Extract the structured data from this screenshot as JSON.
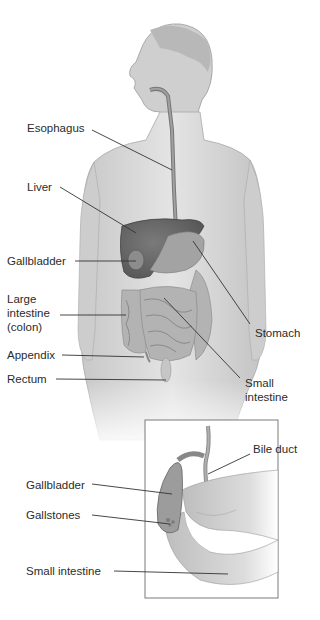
{
  "diagram": {
    "type": "anatomy-illustration",
    "palette": {
      "ink": "#2b2b2b",
      "skin": "#d6d6d6",
      "organ_dark": "#6a6a6a",
      "organ_mid": "#9a9a9a",
      "frame": "#7a7a7a"
    },
    "main_labels": [
      {
        "id": "esophagus",
        "text": "Esophagus"
      },
      {
        "id": "liver",
        "text": "Liver"
      },
      {
        "id": "gallbladder",
        "text": "Gallbladder"
      },
      {
        "id": "large_intestine",
        "text": "Large intestine (colon)",
        "lines": [
          "Large",
          "intestine",
          "(colon)"
        ]
      },
      {
        "id": "appendix",
        "text": "Appendix"
      },
      {
        "id": "rectum",
        "text": "Rectum"
      },
      {
        "id": "stomach",
        "text": "Stomach"
      },
      {
        "id": "small_intestine",
        "text": "Small intestine",
        "lines": [
          "Small",
          "intestine"
        ]
      }
    ],
    "inset_labels": [
      {
        "id": "bile_duct",
        "text": "Bile duct"
      },
      {
        "id": "gallbladder",
        "text": "Gallbladder"
      },
      {
        "id": "gallstones",
        "text": "Gallstones"
      },
      {
        "id": "small_intestine",
        "text": "Small intestine"
      }
    ],
    "caption_fragment": ""
  }
}
